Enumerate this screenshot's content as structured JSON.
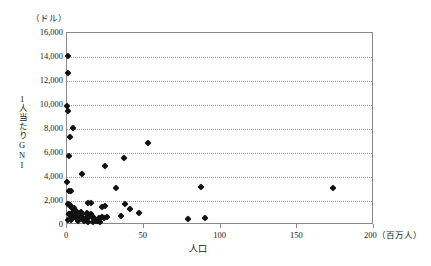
{
  "figure": {
    "top_bleed_text": "",
    "y_axis_unit": "（ドル）",
    "y_axis_title": "1人当たりGNI",
    "x_axis_title": "人口",
    "x_axis_unit": "（百万人）"
  },
  "chart_data": {
    "type": "scatter",
    "title": "",
    "xlabel": "人口",
    "ylabel": "1人当たりGNI",
    "xunit": "（百万人）",
    "yunit": "（ドル）",
    "xlim": [
      0,
      200
    ],
    "ylim": [
      0,
      16000
    ],
    "xticks": [
      0,
      50,
      100,
      150,
      200
    ],
    "xtick_labels": [
      "0",
      "50",
      "100",
      "150",
      "200"
    ],
    "yticks": [
      0,
      2000,
      4000,
      6000,
      8000,
      10000,
      12000,
      14000,
      16000
    ],
    "ytick_labels": [
      "0",
      "2,000",
      "4,000",
      "6,000",
      "8,000",
      "10,000",
      "12,000",
      "14,000",
      "16,000"
    ],
    "grid": "horizontal-dotted",
    "legend": "none",
    "marker": "diamond",
    "marker_color": "#111111",
    "series": [
      {
        "name": "国",
        "points": [
          [
            0.4,
            14050
          ],
          [
            0.8,
            12700
          ],
          [
            0.3,
            9900
          ],
          [
            0.5,
            9500
          ],
          [
            4.0,
            8050
          ],
          [
            1.8,
            7300
          ],
          [
            53.0,
            6800
          ],
          [
            1.5,
            5750
          ],
          [
            37.0,
            5600
          ],
          [
            25.0,
            4900
          ],
          [
            9.5,
            4250
          ],
          [
            0.3,
            3550
          ],
          [
            32.0,
            3100
          ],
          [
            87.0,
            3150
          ],
          [
            173.0,
            3050
          ],
          [
            1.5,
            2820
          ],
          [
            2.6,
            2800
          ],
          [
            0.4,
            1750
          ],
          [
            1.2,
            1700
          ],
          [
            2.0,
            1650
          ],
          [
            13.5,
            1800
          ],
          [
            15.5,
            1820
          ],
          [
            22.5,
            1520
          ],
          [
            25.0,
            1560
          ],
          [
            37.5,
            1780
          ],
          [
            41.0,
            1330
          ],
          [
            47.0,
            1030
          ],
          [
            3.0,
            1450
          ],
          [
            4.5,
            1380
          ],
          [
            6.0,
            1200
          ],
          [
            1.0,
            950
          ],
          [
            1.6,
            880
          ],
          [
            2.2,
            820
          ],
          [
            3.2,
            760
          ],
          [
            4.0,
            700
          ],
          [
            5.0,
            660
          ],
          [
            5.8,
            600
          ],
          [
            6.6,
            560
          ],
          [
            7.4,
            520
          ],
          [
            8.2,
            640
          ],
          [
            9.0,
            700
          ],
          [
            9.8,
            560
          ],
          [
            10.6,
            480
          ],
          [
            11.4,
            420
          ],
          [
            12.2,
            620
          ],
          [
            13.0,
            700
          ],
          [
            13.8,
            560
          ],
          [
            14.6,
            800
          ],
          [
            15.4,
            880
          ],
          [
            16.2,
            760
          ],
          [
            17.0,
            640
          ],
          [
            17.8,
            520
          ],
          [
            18.6,
            420
          ],
          [
            19.4,
            360
          ],
          [
            20.2,
            300
          ],
          [
            21.0,
            560
          ],
          [
            23.0,
            660
          ],
          [
            24.0,
            620
          ],
          [
            26.0,
            700
          ],
          [
            35.5,
            760
          ],
          [
            79.0,
            500
          ],
          [
            90.0,
            620
          ],
          [
            0.9,
            430
          ],
          [
            2.8,
            380
          ],
          [
            7.0,
            330
          ],
          [
            11.0,
            300
          ],
          [
            14.0,
            270
          ],
          [
            16.8,
            250
          ],
          [
            19.0,
            300
          ],
          [
            21.8,
            280
          ],
          [
            6.2,
            1000
          ],
          [
            8.8,
            1080
          ],
          [
            12.8,
            980
          ],
          [
            10.0,
            900
          ],
          [
            3.6,
            1100
          ]
        ]
      }
    ]
  }
}
